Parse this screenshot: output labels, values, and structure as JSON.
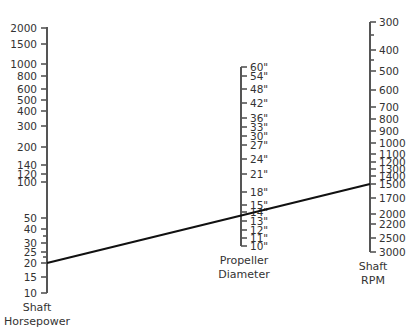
{
  "chart_data": {
    "type": "nomogram",
    "axes": [
      {
        "id": "horsepower",
        "name": "Shaft Horsepower",
        "title_lines": [
          "Shaft",
          "Horsepower"
        ],
        "x": 47,
        "y_top": 27,
        "y_bottom": 293,
        "label_side": "left",
        "ticks": [
          {
            "label": "2000",
            "y": 28
          },
          {
            "label": "1500",
            "y": 44
          },
          {
            "label": "1000",
            "y": 64
          },
          {
            "label": "800",
            "y": 76
          },
          {
            "label": "600",
            "y": 89
          },
          {
            "label": "500",
            "y": 100
          },
          {
            "label": "400",
            "y": 111
          },
          {
            "label": "300",
            "y": 126
          },
          {
            "label": "200",
            "y": 147
          },
          {
            "label": "140",
            "y": 165
          },
          {
            "label": "120",
            "y": 174
          },
          {
            "label": "100",
            "y": 182
          },
          {
            "label": "50",
            "y": 218
          },
          {
            "label": "40",
            "y": 229
          },
          {
            "label": "",
            "y": 236,
            "minor": true
          },
          {
            "label": "30",
            "y": 243
          },
          {
            "label": "25",
            "y": 252
          },
          {
            "label": "",
            "y": 257,
            "minor": true
          },
          {
            "label": "20",
            "y": 263
          },
          {
            "label": "15",
            "y": 277
          },
          {
            "label": "10",
            "y": 293
          }
        ]
      },
      {
        "id": "diameter",
        "name": "Propeller Diameter",
        "title_lines": [
          "Propeller",
          "Diameter"
        ],
        "x": 241,
        "y_top": 67,
        "y_bottom": 246,
        "label_side": "right",
        "ticks": [
          {
            "label": "60\"",
            "y": 67
          },
          {
            "label": "54\"",
            "y": 76
          },
          {
            "label": "48\"",
            "y": 89
          },
          {
            "label": "42\"",
            "y": 103
          },
          {
            "label": "36\"",
            "y": 118
          },
          {
            "label": "33\"",
            "y": 127
          },
          {
            "label": "30\"",
            "y": 136
          },
          {
            "label": "27\"",
            "y": 145
          },
          {
            "label": "24\"",
            "y": 159
          },
          {
            "label": "21\"",
            "y": 174
          },
          {
            "label": "18\"",
            "y": 192
          },
          {
            "label": "15\"",
            "y": 205
          },
          {
            "label": "14\"",
            "y": 212
          },
          {
            "label": "13\"",
            "y": 221
          },
          {
            "label": "12\"",
            "y": 230
          },
          {
            "label": "11\"",
            "y": 238
          },
          {
            "label": "10\"",
            "y": 246
          }
        ]
      },
      {
        "id": "rpm",
        "name": "Shaft RPM",
        "title_lines": [
          "Shaft",
          "RPM"
        ],
        "x": 370,
        "y_top": 22,
        "y_bottom": 252,
        "label_side": "right",
        "ticks": [
          {
            "label": "300",
            "y": 22
          },
          {
            "label": "",
            "y": 35,
            "minor": true
          },
          {
            "label": "400",
            "y": 50
          },
          {
            "label": "",
            "y": 60,
            "minor": true
          },
          {
            "label": "500",
            "y": 71
          },
          {
            "label": "600",
            "y": 90
          },
          {
            "label": "700",
            "y": 107
          },
          {
            "label": "800",
            "y": 119
          },
          {
            "label": "900",
            "y": 131
          },
          {
            "label": "1000",
            "y": 143
          },
          {
            "label": "1100",
            "y": 154
          },
          {
            "label": "1200",
            "y": 162
          },
          {
            "label": "1300",
            "y": 169
          },
          {
            "label": "1400",
            "y": 176
          },
          {
            "label": "1500",
            "y": 184
          },
          {
            "label": "1700",
            "y": 198
          },
          {
            "label": "2000",
            "y": 214
          },
          {
            "label": "2200",
            "y": 224
          },
          {
            "label": "2500",
            "y": 238
          },
          {
            "label": "3000",
            "y": 252
          }
        ]
      }
    ],
    "reading_line": {
      "from": {
        "axis": "horsepower",
        "value": 20,
        "x": 47,
        "y": 263
      },
      "to": {
        "axis": "rpm",
        "value": 1500,
        "x": 370,
        "y": 184
      },
      "crosses": {
        "axis": "diameter",
        "value": "about 14\"-15\""
      }
    },
    "colors": {
      "axis": "#555555",
      "text": "#333333",
      "line": "#111111",
      "background": "#ffffff"
    }
  }
}
